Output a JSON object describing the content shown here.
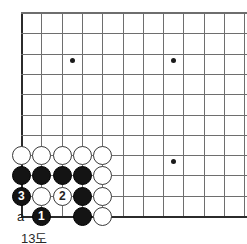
{
  "figure": {
    "kind": "go-board-diagram",
    "caption": "13도",
    "board": {
      "left_edge_x": 21,
      "top_edge_y": 12,
      "bottom_edge_y": 216,
      "spacing": 20.3,
      "columns_visible": 12,
      "rows_visible": 11,
      "line_color": "#6e6e6e",
      "edge_color": "#2b2b2b",
      "background": "#ffffff"
    },
    "star_points": [
      {
        "name": "star-point-upper-left",
        "x": 72,
        "y": 60
      },
      {
        "name": "star-point-upper-right",
        "x": 173,
        "y": 60
      },
      {
        "name": "star-point-lower-right",
        "x": 173,
        "y": 161
      }
    ],
    "stones": [
      {
        "id": "w-r1-c1",
        "color": "white",
        "label": "",
        "x": 21,
        "y": 155
      },
      {
        "id": "w-r1-c2",
        "color": "white",
        "label": "",
        "x": 41,
        "y": 155
      },
      {
        "id": "w-r1-c3",
        "color": "white",
        "label": "",
        "x": 62,
        "y": 155
      },
      {
        "id": "w-r1-c4",
        "color": "white",
        "label": "",
        "x": 82,
        "y": 155
      },
      {
        "id": "w-r1-c5",
        "color": "white",
        "label": "",
        "x": 102,
        "y": 155
      },
      {
        "id": "b-r2-c1",
        "color": "black",
        "label": "",
        "x": 21,
        "y": 175
      },
      {
        "id": "b-r2-c2",
        "color": "black",
        "label": "",
        "x": 41,
        "y": 175
      },
      {
        "id": "b-r2-c3",
        "color": "black",
        "label": "",
        "x": 62,
        "y": 175
      },
      {
        "id": "b-r2-c4",
        "color": "black",
        "label": "",
        "x": 82,
        "y": 175
      },
      {
        "id": "w-r2-c5",
        "color": "white",
        "label": "",
        "x": 102,
        "y": 175
      },
      {
        "id": "b-r3-c1",
        "color": "black",
        "label": "3",
        "x": 21,
        "y": 196
      },
      {
        "id": "w-r3-c2",
        "color": "white",
        "label": "",
        "x": 41,
        "y": 196
      },
      {
        "id": "w-r3-c3",
        "color": "white",
        "label": "2",
        "x": 62,
        "y": 196
      },
      {
        "id": "b-r3-c4",
        "color": "black",
        "label": "",
        "x": 82,
        "y": 196
      },
      {
        "id": "w-r3-c5",
        "color": "white",
        "label": "",
        "x": 102,
        "y": 196
      },
      {
        "id": "b-r4-c2",
        "color": "black",
        "label": "1",
        "x": 41,
        "y": 216
      },
      {
        "id": "b-r4-c4",
        "color": "black",
        "label": "",
        "x": 82,
        "y": 216
      },
      {
        "id": "w-r4-c5",
        "color": "white",
        "label": "",
        "x": 102,
        "y": 216
      }
    ],
    "point_labels": [
      {
        "id": "label-a",
        "text": "a",
        "x": 21,
        "y": 216
      }
    ]
  }
}
